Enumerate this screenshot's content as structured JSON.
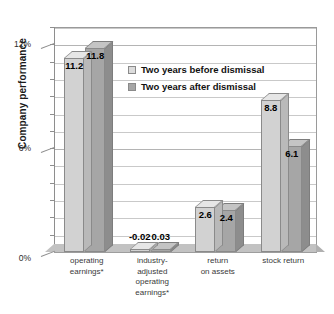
{
  "chart_data": {
    "type": "bar",
    "title": "",
    "xlabel": "",
    "ylabel": "Company performance",
    "categories": [
      "operating earnings*",
      "industry-adjusted operating earnings*",
      "return on assets",
      "stock return"
    ],
    "category_lines": [
      [
        "operating",
        "earnings*"
      ],
      [
        "industry-",
        "adjusted",
        "operating",
        "earnings*"
      ],
      [
        "return",
        "on assets"
      ],
      [
        "stock return"
      ]
    ],
    "series": [
      {
        "name": "Two years before dismissal",
        "values": [
          11.2,
          -0.02,
          2.6,
          8.8
        ],
        "labels": [
          "11.2",
          "-0.02",
          "2.6",
          "8.8"
        ],
        "color": "#d2d2d2"
      },
      {
        "name": "Two years after dismissal",
        "values": [
          11.8,
          0.03,
          2.4,
          6.1
        ],
        "labels": [
          "11.8",
          "0.03",
          "2.4",
          "6.1"
        ],
        "color": "#a6a6a6"
      }
    ],
    "ylim": [
      0,
      13
    ],
    "ytick_values": [
      0,
      6,
      12
    ],
    "ytick_labels": [
      "0%",
      "6%",
      "12%"
    ],
    "minor_gridline_step": 1,
    "grid": true,
    "legend_position": "inside-upper-center",
    "style": "3d-column"
  },
  "legend": {
    "items": [
      {
        "label": "Two years before dismissal",
        "swatch": "before"
      },
      {
        "label": "Two years after dismissal",
        "swatch": "after"
      }
    ]
  },
  "axis": {
    "y_title": "Company performance"
  }
}
